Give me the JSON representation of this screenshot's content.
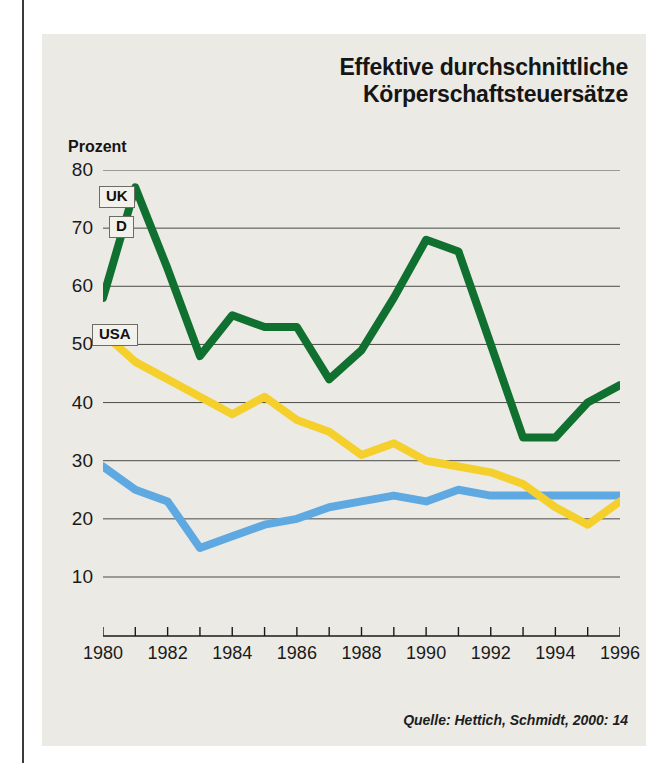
{
  "figure": {
    "title_line1": "Effektive durchschnittliche",
    "title_line2": "Körperschaftsteuersätze",
    "unit_label": "Prozent",
    "source": "Quelle: Hettich, Schmidt, 2000: 14",
    "panel_background": "#eceae4"
  },
  "keys": {
    "uk": "UK",
    "d": "D",
    "usa": "USA"
  },
  "chart_data": {
    "type": "line",
    "title": "Effektive durchschnittliche Körperschaftsteuersätze",
    "subtitle": "",
    "xlabel": "",
    "ylabel": "Prozent",
    "ylim": [
      0,
      80
    ],
    "xlim": [
      1980,
      1996
    ],
    "yticks": [
      80,
      70,
      60,
      50,
      40,
      30,
      20,
      10
    ],
    "xticks": [
      1980,
      1981,
      1982,
      1983,
      1984,
      1985,
      1986,
      1987,
      1988,
      1989,
      1990,
      1991,
      1992,
      1993,
      1994,
      1995,
      1996
    ],
    "xtick_labels_shown": [
      1980,
      1982,
      1984,
      1986,
      1988,
      1990,
      1992,
      1994,
      1996
    ],
    "grid": "horizontal",
    "legend_position": "inline-left-boxes",
    "x": [
      1980,
      1981,
      1982,
      1983,
      1984,
      1985,
      1986,
      1987,
      1988,
      1989,
      1990,
      1991,
      1992,
      1993,
      1994,
      1995,
      1996
    ],
    "series": [
      {
        "name": "UK",
        "color": "#107030",
        "values": [
          58,
          77,
          63,
          48,
          55,
          53,
          53,
          44,
          49,
          58,
          68,
          66,
          50,
          34,
          34,
          40,
          43
        ]
      },
      {
        "name": "D",
        "color": "#F5D02C",
        "values": [
          52,
          47,
          44,
          41,
          38,
          41,
          37,
          35,
          31,
          33,
          30,
          29,
          28,
          26,
          22,
          19,
          23
        ]
      },
      {
        "name": "USA",
        "color": "#5FA9E2",
        "values": [
          29,
          25,
          23,
          15,
          17,
          19,
          20,
          22,
          23,
          24,
          23,
          25,
          24,
          24,
          24,
          24,
          24
        ]
      }
    ],
    "annotations": [
      {
        "text": "Quelle: Hettich, Schmidt, 2000: 14",
        "position": "bottom-right"
      }
    ]
  }
}
